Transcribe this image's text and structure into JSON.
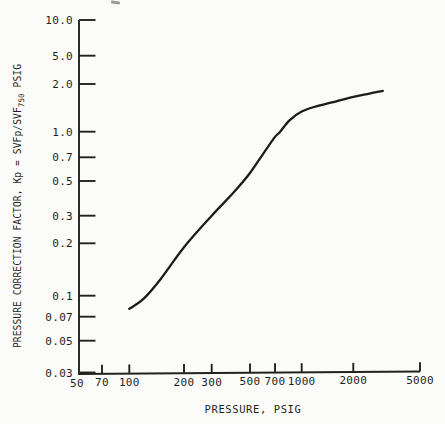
{
  "page": {
    "background": "#fbfbf9",
    "ink": "#222222"
  },
  "labels": {
    "x_title": "PRESSURE, PSIG",
    "y_title_main": "PRESSURE CORRECTION FACTOR, Kp = SVFp/SVF",
    "y_title_sub": "750",
    "y_title_tail": " PSIG"
  },
  "chart_data": {
    "type": "line",
    "title": "",
    "xlabel": "PRESSURE, PSIG",
    "ylabel": "PRESSURE CORRECTION FACTOR, Kp = SVFp/SVF750 PSIG",
    "x_scale": "log",
    "y_scale": "log",
    "xlim": [
      50,
      5000
    ],
    "ylim": [
      0.03,
      10
    ],
    "grid": false,
    "legend": false,
    "x_ticks": [
      50,
      70,
      100,
      200,
      300,
      500,
      700,
      1000,
      2000,
      5000
    ],
    "x_tick_labels": [
      "50",
      "70",
      "100",
      "200",
      "300",
      "500",
      "700",
      "1000",
      "2000",
      "5000"
    ],
    "y_ticks": [
      10,
      5,
      2,
      1,
      0.7,
      0.5,
      0.3,
      0.2,
      0.1,
      0.07,
      0.05,
      0.03
    ],
    "y_tick_labels": [
      "10.0",
      "5.0",
      "2.0",
      "1.0",
      "0.7",
      "0.5",
      "0.3",
      "0.2",
      "0.1",
      "0.07",
      "0.05",
      "0.03"
    ],
    "series": [
      {
        "name": "pressure-correction-factor",
        "points": [
          [
            100,
            0.08
          ],
          [
            120,
            0.095
          ],
          [
            150,
            0.126
          ],
          [
            200,
            0.19
          ],
          [
            300,
            0.3
          ],
          [
            400,
            0.42
          ],
          [
            500,
            0.56
          ],
          [
            600,
            0.74
          ],
          [
            700,
            0.93
          ],
          [
            750,
            1.0
          ],
          [
            850,
            1.18
          ],
          [
            1000,
            1.34
          ],
          [
            1200,
            1.44
          ],
          [
            1500,
            1.53
          ],
          [
            2000,
            1.66
          ],
          [
            2500,
            1.74
          ],
          [
            3000,
            1.81
          ]
        ]
      }
    ]
  }
}
